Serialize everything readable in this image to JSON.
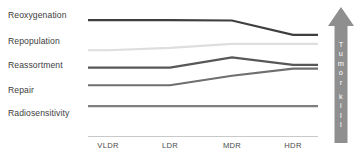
{
  "chart_data": {
    "type": "line",
    "title": "",
    "subtitle": "",
    "xlabel": "",
    "ylabel": "",
    "grid": false,
    "legend_position": "left-labels",
    "categories": [
      "VLDR",
      "LDR",
      "MDR",
      "HDR"
    ],
    "x_tick_labels": [
      "VLDR",
      "LDR",
      "MDR",
      "HDR"
    ],
    "ylim": [
      0,
      5
    ],
    "annotations": [
      {
        "name": "tumor-kill-arrow",
        "text": "Tumor kill",
        "direction": "up",
        "position": "right"
      }
    ],
    "series": [
      {
        "name": "Reoxygenation",
        "color": "#3f3f3f",
        "values": [
          4.62,
          4.62,
          4.6,
          4.0
        ],
        "trend": "flat then decreasing at HDR"
      },
      {
        "name": "Repopulation",
        "color": "#dedede",
        "values": [
          3.35,
          3.45,
          3.62,
          3.62
        ],
        "trend": "slight increase then flat"
      },
      {
        "name": "Reassortment",
        "color": "#575757",
        "values": [
          2.62,
          2.62,
          3.05,
          2.74
        ],
        "trend": "flat, peak at MDR, decline at HDR"
      },
      {
        "name": "Repair",
        "color": "#6f6f6f",
        "values": [
          1.88,
          1.88,
          2.28,
          2.58
        ],
        "trend": "flat then increasing"
      },
      {
        "name": "Radiosensitivity",
        "color": "#7e7e7e",
        "values": [
          1.0,
          1.0,
          1.0,
          1.0
        ],
        "trend": "constant"
      }
    ]
  },
  "row_labels": [
    {
      "text": "Reoxygenation",
      "name": "label-reoxygenation"
    },
    {
      "text": "Repopulation",
      "name": "label-repopulation"
    },
    {
      "text": "Reassortment",
      "name": "label-reassortment"
    },
    {
      "text": "Repair",
      "name": "label-repair"
    },
    {
      "text": "Radiosensitivity",
      "name": "label-radiosensitivity"
    }
  ],
  "axis": {
    "ticks": [
      {
        "label": "VLDR"
      },
      {
        "label": "LDR"
      },
      {
        "label": "MDR"
      },
      {
        "label": "HDR"
      }
    ],
    "line_color": "#c9c9c9"
  },
  "arrow": {
    "label": "Tumor kill",
    "letters": [
      "T",
      "u",
      "m",
      "o",
      "r",
      "",
      "k",
      "i",
      "l",
      "l"
    ],
    "color": "#8f8f8f",
    "text_color": "#ffffff"
  }
}
